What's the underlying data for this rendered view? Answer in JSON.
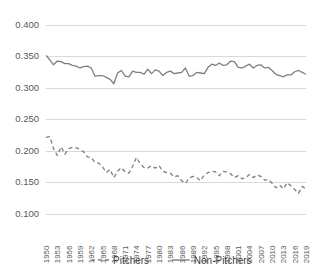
{
  "chart_data": {
    "type": "line",
    "title": "",
    "subtitle": "",
    "xlabel": "",
    "ylabel": "",
    "ylim": [
      0.1,
      0.4
    ],
    "ytick_labels": [
      "0.100",
      "0.150",
      "0.200",
      "0.250",
      "0.300",
      "0.350",
      "0.400"
    ],
    "ytick_values": [
      0.1,
      0.15,
      0.2,
      0.25,
      0.3,
      0.35,
      0.4
    ],
    "grid": true,
    "legend_position": "bottom",
    "x": [
      1950,
      1951,
      1952,
      1953,
      1954,
      1955,
      1956,
      1957,
      1958,
      1959,
      1960,
      1961,
      1962,
      1963,
      1964,
      1965,
      1966,
      1967,
      1968,
      1969,
      1970,
      1971,
      1972,
      1973,
      1974,
      1975,
      1976,
      1977,
      1978,
      1979,
      1980,
      1981,
      1982,
      1983,
      1984,
      1985,
      1986,
      1987,
      1988,
      1989,
      1990,
      1991,
      1992,
      1993,
      1994,
      1995,
      1996,
      1997,
      1998,
      1999,
      2000,
      2001,
      2002,
      2003,
      2004,
      2005,
      2006,
      2007,
      2008,
      2009,
      2010,
      2011,
      2012,
      2013,
      2014,
      2015,
      2016,
      2017,
      2018,
      2019
    ],
    "xtick_labels": [
      "1950",
      "1953",
      "1956",
      "1959",
      "1962",
      "1965",
      "1968",
      "1971",
      "1974",
      "1977",
      "1980",
      "1983",
      "1986",
      "1989",
      "1992",
      "1995",
      "1998",
      "2001",
      "2004",
      "2007",
      "2010",
      "2013",
      "2016",
      "2019"
    ],
    "xtick_values": [
      1950,
      1953,
      1956,
      1959,
      1962,
      1965,
      1968,
      1971,
      1974,
      1977,
      1980,
      1983,
      1986,
      1989,
      1992,
      1995,
      1998,
      2001,
      2004,
      2007,
      2010,
      2013,
      2016,
      2019
    ],
    "series": [
      {
        "name": "Pitchers",
        "style": "dashed",
        "color": "#7f7f7f",
        "values": [
          0.221,
          0.222,
          0.203,
          0.192,
          0.206,
          0.194,
          0.203,
          0.205,
          0.204,
          0.202,
          0.198,
          0.19,
          0.189,
          0.181,
          0.18,
          0.174,
          0.165,
          0.17,
          0.157,
          0.167,
          0.173,
          0.166,
          0.164,
          0.175,
          0.189,
          0.179,
          0.173,
          0.172,
          0.176,
          0.172,
          0.176,
          0.167,
          0.165,
          0.164,
          0.158,
          0.16,
          0.152,
          0.148,
          0.156,
          0.159,
          0.157,
          0.152,
          0.161,
          0.165,
          0.167,
          0.166,
          0.16,
          0.167,
          0.166,
          0.163,
          0.157,
          0.16,
          0.155,
          0.157,
          0.162,
          0.157,
          0.161,
          0.159,
          0.153,
          0.154,
          0.148,
          0.141,
          0.145,
          0.139,
          0.149,
          0.144,
          0.138,
          0.132,
          0.143,
          0.139
        ]
      },
      {
        "name": "Non-Pitchers",
        "style": "solid",
        "color": "#7f7f7f",
        "values": [
          0.351,
          0.344,
          0.336,
          0.342,
          0.341,
          0.338,
          0.338,
          0.335,
          0.334,
          0.331,
          0.333,
          0.334,
          0.331,
          0.318,
          0.319,
          0.319,
          0.316,
          0.313,
          0.306,
          0.323,
          0.327,
          0.318,
          0.317,
          0.326,
          0.324,
          0.324,
          0.321,
          0.329,
          0.322,
          0.328,
          0.326,
          0.319,
          0.324,
          0.326,
          0.322,
          0.323,
          0.324,
          0.331,
          0.318,
          0.319,
          0.324,
          0.323,
          0.322,
          0.332,
          0.337,
          0.335,
          0.339,
          0.335,
          0.336,
          0.342,
          0.341,
          0.332,
          0.331,
          0.334,
          0.337,
          0.331,
          0.335,
          0.336,
          0.331,
          0.332,
          0.327,
          0.321,
          0.319,
          0.317,
          0.32,
          0.32,
          0.325,
          0.327,
          0.324,
          0.321
        ]
      }
    ],
    "legend": [
      {
        "label": "Pitchers",
        "style": "dashed"
      },
      {
        "label": "Non-Pitchers",
        "style": "solid"
      }
    ]
  }
}
